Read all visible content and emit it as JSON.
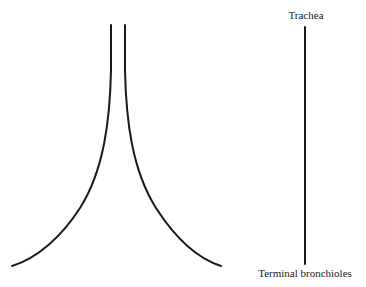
{
  "diagram": {
    "labels": {
      "top": "Trachea",
      "bottom": "Terminal bronchioles"
    },
    "colors": {
      "line": "#1a1a1a",
      "background": "#ffffff"
    }
  }
}
